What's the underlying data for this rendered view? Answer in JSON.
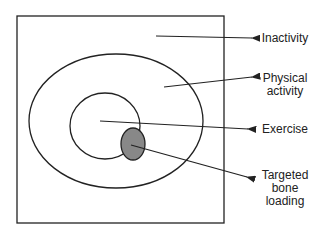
{
  "diagram": {
    "type": "nested-sets",
    "colors": {
      "stroke": "#222222",
      "fill_targeted": "#888888",
      "background": "#ffffff"
    },
    "labels": {
      "inactivity": "Inactivity",
      "physical_activity_1": "Physical",
      "physical_activity_2": "activity",
      "exercise": "Exercise",
      "targeted_1": "Targeted",
      "targeted_2": "bone",
      "targeted_3": "loading"
    }
  }
}
